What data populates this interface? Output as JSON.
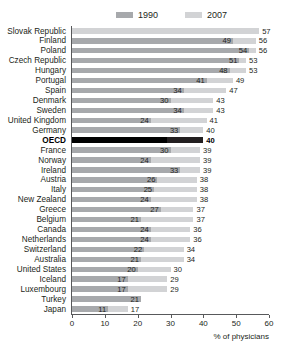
{
  "legend": {
    "entries": [
      {
        "label": "1990",
        "color": "#a7a9ac"
      },
      {
        "label": "2007",
        "color": "#d2d3d5"
      }
    ]
  },
  "axis": {
    "title": "% of physicians",
    "ticks": [
      "0",
      "10",
      "20",
      "30",
      "40",
      "50",
      "60"
    ]
  },
  "chart_data": {
    "type": "bar",
    "orientation": "horizontal",
    "title": "",
    "subtitle": "",
    "xlabel": "% of physicians",
    "ylabel": "",
    "xlim": [
      0,
      60
    ],
    "xticks": [
      0,
      10,
      20,
      30,
      40,
      50,
      60
    ],
    "grid": false,
    "legend_position": "top",
    "highlight_category": "OECD",
    "categories": [
      "Slovak Republic",
      "Finland",
      "Poland",
      "Czech Republic",
      "Hungary",
      "Portugal",
      "Spain",
      "Denmark",
      "Sweden",
      "United Kingdom",
      "Germany",
      "OECD",
      "France",
      "Norway",
      "Ireland",
      "Austria",
      "Italy",
      "New Zealand",
      "Greece",
      "Belgium",
      "Canada",
      "Netherlands",
      "Switzerland",
      "Australia",
      "United States",
      "Iceland",
      "Luxembourg",
      "Turkey",
      "Japan"
    ],
    "series": [
      {
        "name": "1990",
        "color": "#a7a9ac",
        "values": [
          null,
          49,
          54,
          51,
          48,
          41,
          34,
          30,
          34,
          24,
          33,
          29,
          30,
          24,
          33,
          26,
          25,
          24,
          27,
          21,
          24,
          24,
          22,
          21,
          20,
          17,
          17,
          21,
          11
        ]
      },
      {
        "name": "2007",
        "color": "#d2d3d5",
        "values": [
          57,
          56,
          56,
          53,
          53,
          49,
          47,
          43,
          43,
          41,
          40,
          40,
          39,
          39,
          39,
          38,
          38,
          38,
          37,
          37,
          36,
          36,
          34,
          34,
          30,
          29,
          29,
          null,
          17
        ]
      }
    ]
  }
}
